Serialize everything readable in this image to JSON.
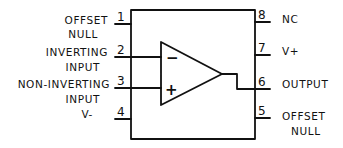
{
  "diagram": {
    "left_pins": [
      {
        "number": "1",
        "label_line1": "OFFSET",
        "label_line2": "NULL"
      },
      {
        "number": "2",
        "label_line1": "INVERTING",
        "label_line2": "INPUT"
      },
      {
        "number": "3",
        "label_line1": "NON-INVERTING",
        "label_line2": "INPUT"
      },
      {
        "number": "4",
        "label_line1": "V-",
        "label_line2": ""
      }
    ],
    "right_pins": [
      {
        "number": "8",
        "label_line1": "NC",
        "label_line2": ""
      },
      {
        "number": "7",
        "label_line1": "V+",
        "label_line2": ""
      },
      {
        "number": "6",
        "label_line1": "OUTPUT",
        "label_line2": ""
      },
      {
        "number": "5",
        "label_line1": "OFFSET",
        "label_line2": "NULL"
      }
    ],
    "opamp": {
      "inverting_sign": "−",
      "noninverting_sign": "+"
    }
  }
}
